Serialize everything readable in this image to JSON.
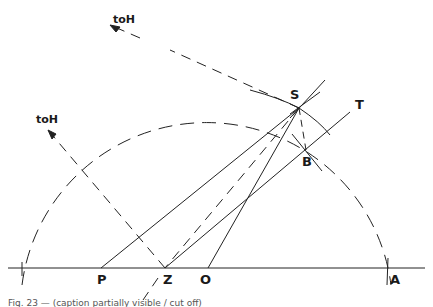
{
  "figure": {
    "type": "geometric-construction",
    "labels": {
      "toH_top": "toH",
      "toH_left": "toH",
      "S": "S",
      "T": "T",
      "B": "B",
      "P": "P",
      "Z": "Z",
      "O": "O",
      "A": "A"
    },
    "caption": "Fig. 23 — (caption partially visible / cut off)",
    "points": {
      "S": [
        299,
        108
      ],
      "T": [
        352,
        111
      ],
      "B": [
        306,
        150
      ],
      "P": [
        101,
        268
      ],
      "Z": [
        165,
        268
      ],
      "O": [
        208,
        268
      ],
      "A": [
        390,
        268
      ]
    },
    "colors": {
      "ink": "#1a1a1a",
      "paper": "#ffffff"
    }
  }
}
